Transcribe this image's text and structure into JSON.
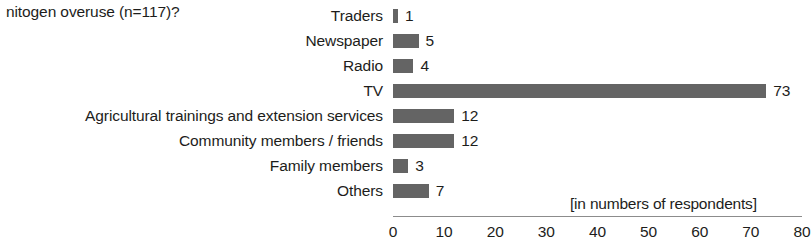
{
  "question": {
    "text": "nitogen overuse (n=117)?"
  },
  "chart_data": {
    "type": "bar",
    "orientation": "horizontal",
    "title": "",
    "subtitle": "",
    "xlabel": "[in numbers of respondents]",
    "ylabel": "",
    "categories": [
      "Traders",
      "Newspaper",
      "Radio",
      "TV",
      "Agricultural trainings and extension services",
      "Community members / friends",
      "Family members",
      "Others"
    ],
    "values": [
      1,
      5,
      4,
      73,
      12,
      12,
      3,
      7
    ],
    "data_labels": [
      "1",
      "5",
      "4",
      "73",
      "12",
      "12",
      "3",
      "7"
    ],
    "xlim": [
      0,
      80
    ],
    "xticks": [
      0,
      10,
      20,
      30,
      40,
      50,
      60,
      70,
      80
    ],
    "xtick_labels": [
      "0",
      "10",
      "20",
      "30",
      "40",
      "50",
      "60",
      "70",
      "80"
    ],
    "grid": false,
    "legend": null,
    "bar_color": "#646464",
    "axis_color": "#8c8c8c",
    "background": "#ffffff",
    "annotations": [
      "[in numbers of respondents]"
    ]
  },
  "axis_note": {
    "text": "[in numbers of respondents]"
  }
}
